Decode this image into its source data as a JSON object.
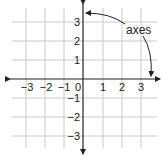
{
  "diagram": {
    "type": "coordinate-plane",
    "annotation": "axes",
    "origin_label": "0",
    "x_ticks": [
      {
        "value": -3,
        "label": "−3"
      },
      {
        "value": -2,
        "label": "−2"
      },
      {
        "value": -1,
        "label": "−1"
      },
      {
        "value": 1,
        "label": "1"
      },
      {
        "value": 2,
        "label": "2"
      },
      {
        "value": 3,
        "label": "3"
      }
    ],
    "y_ticks": [
      {
        "value": 3,
        "label": "3"
      },
      {
        "value": 2,
        "label": "2"
      },
      {
        "value": 1,
        "label": "1"
      },
      {
        "value": -1,
        "label": "−1"
      },
      {
        "value": -2,
        "label": "−2"
      },
      {
        "value": -3,
        "label": "−3"
      }
    ],
    "colors": {
      "grid": "#c8c8c8",
      "axis": "#222222",
      "text": "#222222"
    }
  }
}
